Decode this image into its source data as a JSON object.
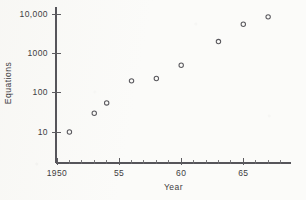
{
  "chart_data": {
    "type": "scatter",
    "title": "",
    "xlabel": "Year",
    "ylabel": "Equations",
    "yscale": "log",
    "xlim": [
      1950,
      1968.8
    ],
    "ylim": [
      4.5,
      18000
    ],
    "grid": false,
    "legend": null,
    "marker_style": "open-circle",
    "x": [
      1951,
      1953,
      1954,
      1956,
      1958,
      1960,
      1963,
      1965,
      1967
    ],
    "values": [
      10,
      30,
      55,
      200,
      230,
      500,
      2000,
      5500,
      8500
    ],
    "points": [
      {
        "x": 1951,
        "y": 10
      },
      {
        "x": 1953,
        "y": 30
      },
      {
        "x": 1954,
        "y": 55
      },
      {
        "x": 1956,
        "y": 200
      },
      {
        "x": 1958,
        "y": 230
      },
      {
        "x": 1960,
        "y": 500
      },
      {
        "x": 1963,
        "y": 2000
      },
      {
        "x": 1965,
        "y": 5500
      },
      {
        "x": 1967,
        "y": 8500
      }
    ],
    "yticks": [
      {
        "value": 10,
        "label": "10"
      },
      {
        "value": 100,
        "label": "100"
      },
      {
        "value": 1000,
        "label": "1000"
      },
      {
        "value": 10000,
        "label": "10,000"
      }
    ],
    "xticks": [
      {
        "value": 1950,
        "label": "1950"
      },
      {
        "value": 1951,
        "label": ""
      },
      {
        "value": 1952,
        "label": ""
      },
      {
        "value": 1953,
        "label": ""
      },
      {
        "value": 1954,
        "label": ""
      },
      {
        "value": 1955,
        "label": "55"
      },
      {
        "value": 1956,
        "label": ""
      },
      {
        "value": 1957,
        "label": ""
      },
      {
        "value": 1958,
        "label": ""
      },
      {
        "value": 1959,
        "label": ""
      },
      {
        "value": 1960,
        "label": "60"
      },
      {
        "value": 1961,
        "label": ""
      },
      {
        "value": 1962,
        "label": ""
      },
      {
        "value": 1963,
        "label": ""
      },
      {
        "value": 1964,
        "label": ""
      },
      {
        "value": 1965,
        "label": "65"
      },
      {
        "value": 1966,
        "label": ""
      },
      {
        "value": 1967,
        "label": ""
      },
      {
        "value": 1968,
        "label": ""
      }
    ],
    "colors": {
      "axis": "#56555a",
      "marker": "#5a595e",
      "text": "#3e3d42",
      "background": "#fbfbf9"
    }
  }
}
